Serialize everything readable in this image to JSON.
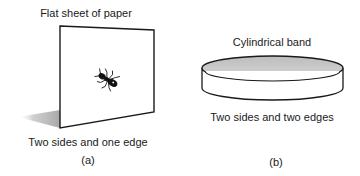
{
  "panel_a": {
    "title": "Flat sheet of paper",
    "caption": "Two sides and one edge",
    "label": "(a)",
    "shape": "flat-sheet-with-ant",
    "colors": {
      "stroke": "#1a1a1a",
      "sheet": "#ffffff",
      "shadow": "#b5b5b5"
    }
  },
  "panel_b": {
    "title": "Cylindrical band",
    "caption": "Two sides and two edges",
    "label": "(b)",
    "shape": "cylindrical-band",
    "colors": {
      "stroke": "#1a1a1a",
      "inner_surface": "#c9c9c9",
      "outer_surface": "#ffffff"
    }
  }
}
